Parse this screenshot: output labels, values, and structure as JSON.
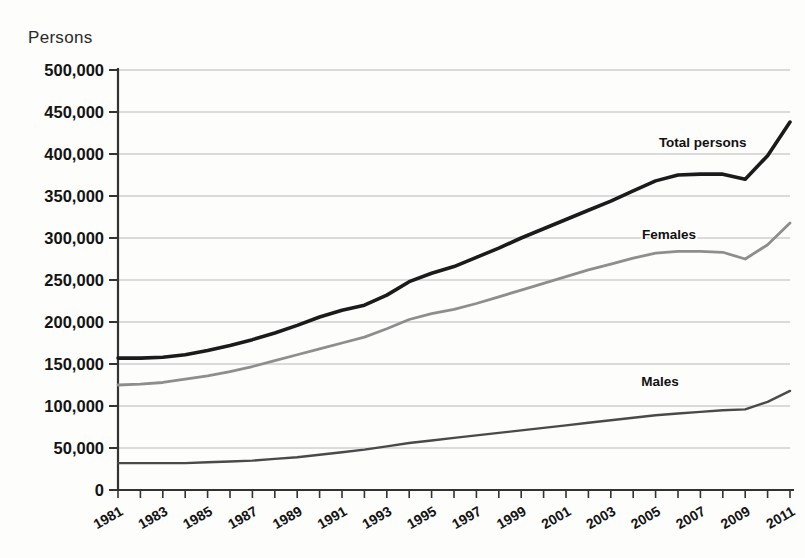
{
  "chart_data": {
    "type": "line",
    "title": "",
    "ylabel": "Persons",
    "xlabel": "",
    "ylim": [
      0,
      500000
    ],
    "xlim": [
      1981,
      2011
    ],
    "grid": true,
    "legend_position": "inline-labels",
    "ytick_labels": [
      "500,000",
      "450,000",
      "400,000",
      "350,000",
      "300,000",
      "250,000",
      "200,000",
      "150,000",
      "100,000",
      "50,000",
      "0"
    ],
    "ytick_values": [
      500000,
      450000,
      400000,
      350000,
      300000,
      250000,
      200000,
      150000,
      100000,
      50000,
      0
    ],
    "xtick_labels": [
      "1981",
      "1983",
      "1985",
      "1987",
      "1989",
      "1991",
      "1993",
      "1995",
      "1997",
      "1999",
      "2001",
      "2003",
      "2005",
      "2007",
      "2009",
      "2011"
    ],
    "x": [
      1981,
      1982,
      1983,
      1984,
      1985,
      1986,
      1987,
      1988,
      1989,
      1990,
      1991,
      1992,
      1993,
      1994,
      1995,
      1996,
      1997,
      1998,
      1999,
      2000,
      2001,
      2002,
      2003,
      2004,
      2005,
      2006,
      2007,
      2008,
      2009,
      2010,
      2011
    ],
    "series": [
      {
        "name": "Total persons",
        "color": "#1b1b1b",
        "width": 3.6,
        "label_x": 2007.1,
        "label_y": 408000,
        "values": [
          157000,
          157000,
          158000,
          161000,
          166000,
          172000,
          179000,
          187000,
          196000,
          206000,
          214000,
          220000,
          232000,
          248000,
          258000,
          266000,
          277000,
          288000,
          300000,
          311000,
          322000,
          333000,
          344000,
          356000,
          368000,
          375000,
          376000,
          376000,
          370000,
          398000,
          438000
        ]
      },
      {
        "name": "Females",
        "color": "#8e8e8e",
        "width": 2.8,
        "label_x": 2005.6,
        "label_y": 299000,
        "values": [
          125000,
          126000,
          128000,
          132000,
          136000,
          141000,
          147000,
          154000,
          161000,
          168000,
          175000,
          182000,
          192000,
          203000,
          210000,
          215000,
          222000,
          230000,
          238000,
          246000,
          254000,
          262000,
          269000,
          276000,
          282000,
          284000,
          284000,
          283000,
          275000,
          292000,
          318000
        ]
      },
      {
        "name": "Males",
        "color": "#4a4a4a",
        "width": 2.4,
        "label_x": 2005.2,
        "label_y": 124000,
        "values": [
          32000,
          32000,
          32000,
          32000,
          33000,
          34000,
          35000,
          37000,
          39000,
          42000,
          45000,
          48000,
          52000,
          56000,
          59000,
          62000,
          65000,
          68000,
          71000,
          74000,
          77000,
          80000,
          83000,
          86000,
          89000,
          91000,
          93000,
          95000,
          96000,
          105000,
          118000
        ]
      }
    ]
  },
  "layout": {
    "plot_left": 118,
    "plot_right": 790,
    "plot_top": 70,
    "plot_bottom": 490
  }
}
